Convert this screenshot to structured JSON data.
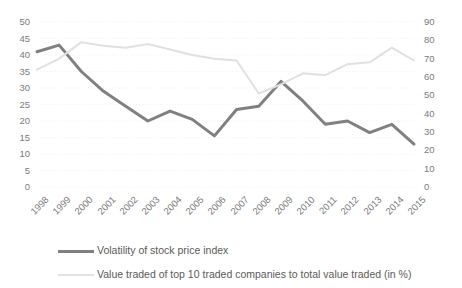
{
  "chart_data": {
    "type": "line",
    "title": "",
    "xlabel": "",
    "ylabel": "",
    "grid": true,
    "legend_position": "bottom-left",
    "categories": [
      "1998",
      "1999",
      "2000",
      "2001",
      "2002",
      "2003",
      "2004",
      "2005",
      "2006",
      "2007",
      "2008",
      "2009",
      "2010",
      "2011",
      "2012",
      "2013",
      "2014",
      "2015"
    ],
    "axes": {
      "left": {
        "ylim": [
          0,
          50
        ],
        "ticks": [
          0,
          5,
          10,
          15,
          20,
          25,
          30,
          35,
          40,
          45,
          50
        ],
        "tick_labels": [
          "0",
          "5",
          "10",
          "15",
          "20",
          "25",
          "30",
          "35",
          "40",
          "45",
          "50"
        ]
      },
      "right": {
        "ylim": [
          0,
          90
        ],
        "ticks": [
          0,
          10,
          20,
          30,
          40,
          50,
          60,
          70,
          80,
          90
        ],
        "tick_labels": [
          "0",
          "10",
          "20",
          "30",
          "40",
          "50",
          "60",
          "70",
          "80",
          "90"
        ]
      }
    },
    "series": [
      {
        "name": "Volatility of stock price index",
        "axis": "left",
        "color": "#808080",
        "style": "solid",
        "width": 3,
        "values": [
          41,
          43,
          35,
          29,
          24.5,
          20,
          23,
          20.5,
          15.5,
          23.5,
          24.5,
          32,
          26,
          19,
          20,
          16.5,
          19,
          13
        ]
      },
      {
        "name": "Value traded of top 10 traded companies to total value traded (in %)",
        "axis": "right",
        "color": "#e0e0e0",
        "style": "solid",
        "width": 2,
        "values": [
          64,
          70,
          79,
          77,
          76,
          78,
          75,
          72,
          70,
          69,
          51,
          56,
          62,
          61,
          67,
          68,
          76,
          69
        ]
      }
    ]
  },
  "legend": {
    "items": [
      {
        "label": "Volatility of stock price index",
        "swatch": "dark"
      },
      {
        "label": "Value traded of top 10 traded companies to total value traded (in %)",
        "swatch": "light"
      }
    ]
  }
}
